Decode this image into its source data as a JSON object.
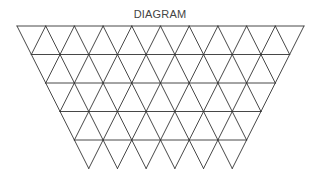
{
  "title": "DIAGRAM",
  "diagram": {
    "type": "inverted-triangle-grid",
    "rows": 5,
    "top_row_triangles": 10,
    "top_y": 26,
    "left_x": 17,
    "right_x": 304,
    "row_height": 28.5,
    "stroke_color": "#333333",
    "stroke_width": 0.9
  }
}
